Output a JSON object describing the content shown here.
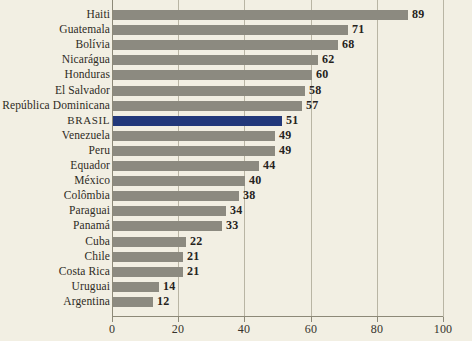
{
  "chart_data": {
    "type": "bar",
    "orientation": "horizontal",
    "title": "",
    "subtitle": "",
    "xlabel": "",
    "ylabel": "",
    "xlim": [
      0,
      100
    ],
    "xticks": [
      0,
      20,
      40,
      60,
      80,
      100
    ],
    "xtick_labels": [
      "0",
      "20",
      "40",
      "60",
      "80",
      "100"
    ],
    "grid": true,
    "legend": "none",
    "highlight_category": "BRASIL",
    "colors": {
      "background": "#f2efe3",
      "bar": "#8c8a80",
      "bar_highlight": "#22387a",
      "gridline": "#b9b5a4",
      "axis": "#8d8978",
      "text": "#2e2b24"
    },
    "categories": [
      "Haiti",
      "Guatemala",
      "Bolívia",
      "Nicarágua",
      "Honduras",
      "El Salvador",
      "República Dominicana",
      "BRASIL",
      "Venezuela",
      "Peru",
      "Equador",
      "México",
      "Colômbia",
      "Paraguai",
      "Panamá",
      "Cuba",
      "Chile",
      "Costa Rica",
      "Uruguai",
      "Argentina"
    ],
    "values": [
      89,
      71,
      68,
      62,
      60,
      58,
      57,
      51,
      49,
      49,
      44,
      40,
      38,
      34,
      33,
      22,
      21,
      21,
      14,
      12
    ],
    "value_labels": [
      "89",
      "71",
      "68",
      "62",
      "60",
      "58",
      "57",
      "51",
      "49",
      "49",
      "44",
      "40",
      "38",
      "34",
      "33",
      "22",
      "21",
      "21",
      "14",
      "12"
    ]
  }
}
